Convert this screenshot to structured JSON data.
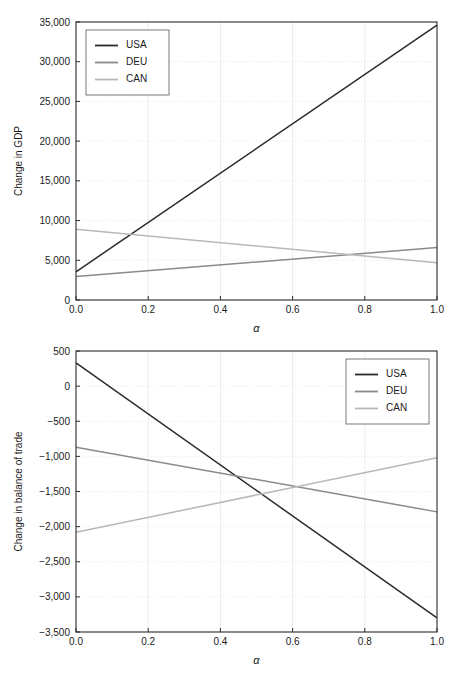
{
  "figure": {
    "background": "#ffffff",
    "panel_count": 2
  },
  "chart_data": [
    {
      "id": "gdp",
      "type": "line",
      "title": "",
      "xlabel": "α",
      "ylabel": "Change in GDP",
      "x": [
        0.0,
        1.0
      ],
      "xlim": [
        0.0,
        1.0
      ],
      "ylim": [
        0,
        35000
      ],
      "xticks": [
        0.0,
        0.2,
        0.4,
        0.6,
        0.8,
        1.0
      ],
      "xticklabels": [
        "0.0",
        "0.2",
        "0.4",
        "0.6",
        "0.8",
        "1.0"
      ],
      "yticks": [
        0,
        5000,
        10000,
        15000,
        20000,
        25000,
        30000,
        35000
      ],
      "yticklabels": [
        "0",
        "5,000",
        "10,000",
        "15,000",
        "20,000",
        "25,000",
        "30,000",
        "35,000"
      ],
      "grid": true,
      "legend_position": "upper-left",
      "series": [
        {
          "name": "USA",
          "color": "#2b2b2b",
          "values": [
            3550,
            34600
          ]
        },
        {
          "name": "DEU",
          "color": "#8a8a8a",
          "values": [
            2950,
            6600
          ]
        },
        {
          "name": "CAN",
          "color": "#b8b8b8",
          "values": [
            8900,
            4700
          ]
        }
      ]
    },
    {
      "id": "balance-of-trade",
      "type": "line",
      "title": "",
      "xlabel": "α",
      "ylabel": "Change in balance of trade",
      "x": [
        0.0,
        1.0
      ],
      "xlim": [
        0.0,
        1.0
      ],
      "ylim": [
        -3500,
        500
      ],
      "xticks": [
        0.0,
        0.2,
        0.4,
        0.6,
        0.8,
        1.0
      ],
      "xticklabels": [
        "0.0",
        "0.2",
        "0.4",
        "0.6",
        "0.8",
        "1.0"
      ],
      "yticks": [
        -3500,
        -3000,
        -2500,
        -2000,
        -1500,
        -1000,
        -500,
        0,
        500
      ],
      "yticklabels": [
        "−3,500",
        "−3,000",
        "−2,500",
        "−2,000",
        "−1,500",
        "−1,000",
        "−500",
        "0",
        "500"
      ],
      "grid": true,
      "legend_position": "upper-right",
      "series": [
        {
          "name": "USA",
          "color": "#2b2b2b",
          "values": [
            330,
            -3300
          ]
        },
        {
          "name": "DEU",
          "color": "#8a8a8a",
          "values": [
            -870,
            -1790
          ]
        },
        {
          "name": "CAN",
          "color": "#b8b8b8",
          "values": [
            -2080,
            -1020
          ]
        }
      ]
    }
  ]
}
